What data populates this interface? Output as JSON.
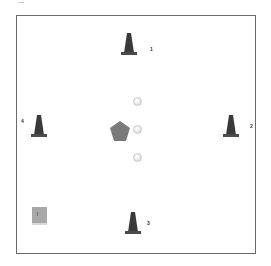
{
  "diagram": {
    "type": "drill-layout",
    "cones": [
      {
        "id": "cone-1",
        "label": "1",
        "x": 121,
        "y": 32
      },
      {
        "id": "cone-2",
        "label": "2",
        "x": 223,
        "y": 114
      },
      {
        "id": "cone-3",
        "label": "3",
        "x": 125,
        "y": 211
      },
      {
        "id": "cone-4",
        "label": "4",
        "x": 31,
        "y": 114
      }
    ],
    "balls": 3,
    "pentagon": "player-marker",
    "square": "goal-marker",
    "colors": {
      "cone": "#3a3a3a",
      "pentagon": "#7a7a7a",
      "frame": "#6a6a6a"
    }
  }
}
